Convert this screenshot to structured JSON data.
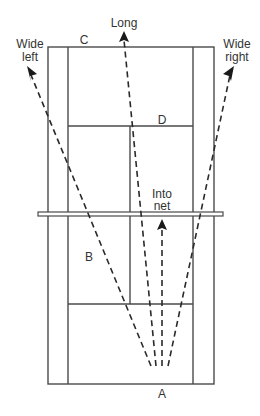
{
  "diagram": {
    "labels": {
      "C": "C",
      "D": "D",
      "B": "B",
      "A": "A",
      "long": "Long",
      "wide_left_1": "Wide",
      "wide_left_2": "left",
      "wide_right_1": "Wide",
      "wide_right_2": "right",
      "into_net_1": "Into",
      "into_net_2": "net"
    },
    "colors": {
      "lines": "#4a4a4a",
      "shots": "#2a2a2a",
      "text": "#333333",
      "background": "#ffffff"
    },
    "shots": [
      {
        "name": "Wide left",
        "from": [
          151,
          366
        ],
        "to": [
          28,
          68
        ]
      },
      {
        "name": "Long",
        "from": [
          156,
          366
        ],
        "to": [
          124,
          32
        ]
      },
      {
        "name": "Into net",
        "from": [
          162,
          366
        ],
        "to": [
          162,
          220
        ]
      },
      {
        "name": "Wide right",
        "from": [
          168,
          366
        ],
        "to": [
          233,
          68
        ]
      }
    ]
  }
}
